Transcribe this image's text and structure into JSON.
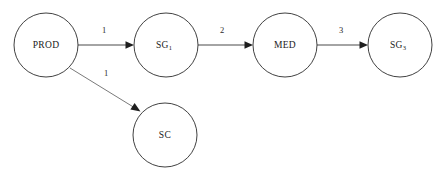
{
  "diagram": {
    "canvas": {
      "width": 446,
      "height": 178,
      "background": "#ffffff"
    },
    "colors": {
      "node_stroke": "#2b2b2b",
      "node_fill": "#ffffff",
      "edge_stroke": "#4a4a4a",
      "edge_stroke_light": "#6a6a6a",
      "arrow_fill": "#1e1e1e",
      "text": "#1a1a1a"
    },
    "nodes": [
      {
        "id": "prod",
        "label": "PROD",
        "sub": "",
        "cx": 46,
        "cy": 45,
        "r": 32
      },
      {
        "id": "sg1",
        "label": "SG",
        "sub": "1",
        "cx": 166,
        "cy": 45,
        "r": 32
      },
      {
        "id": "med",
        "label": "MED",
        "sub": "",
        "cx": 285,
        "cy": 45,
        "r": 32
      },
      {
        "id": "sg3",
        "label": "SG",
        "sub": "3",
        "cx": 400,
        "cy": 45,
        "r": 32
      },
      {
        "id": "sc",
        "label": "SC",
        "sub": "",
        "cx": 165,
        "cy": 135,
        "r": 32
      }
    ],
    "edges": [
      {
        "id": "prod-sg1",
        "from": "PROD",
        "to": "SG1",
        "weight": "1",
        "label_x": 104,
        "label_y": 31
      },
      {
        "id": "sg1-med",
        "from": "SG1",
        "to": "MED",
        "weight": "2",
        "label_x": 222,
        "label_y": 31
      },
      {
        "id": "med-sg3",
        "from": "MED",
        "to": "SG3",
        "weight": "3",
        "label_x": 341,
        "label_y": 31
      },
      {
        "id": "prod-sc",
        "from": "PROD",
        "to": "SC",
        "weight": "1",
        "label_x": 106,
        "label_y": 74
      }
    ]
  }
}
